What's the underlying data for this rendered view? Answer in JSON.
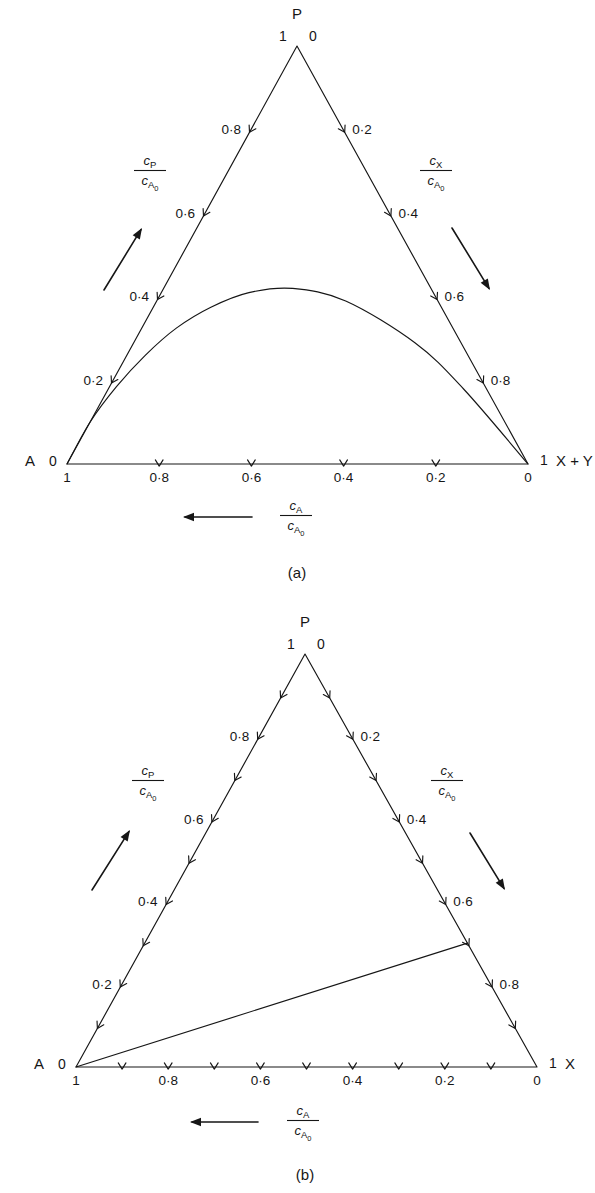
{
  "figure": {
    "type": "ternary-composition-diagrams",
    "panels": [
      {
        "id": "a",
        "caption": "(a)",
        "vertices": {
          "top": {
            "label": "P",
            "left_value": "1",
            "right_value": "0"
          },
          "left": {
            "label": "A",
            "value": "0",
            "bottom_value": "1"
          },
          "right": {
            "label": "X + Y",
            "value": "1",
            "bottom_value": "0"
          }
        },
        "axes": {
          "left": {
            "name": "c_P/c_A0",
            "numerator": "c",
            "numerator_sub": "P",
            "denominator": "c",
            "denominator_sub": "A",
            "denominator_subsub": "0",
            "arrow_direction": "up-right",
            "tick_labels": [
              "0·2",
              "0·4",
              "0·6",
              "0·8"
            ],
            "tick_values": [
              0.2,
              0.4,
              0.6,
              0.8
            ],
            "minor_tick_step": 0.2
          },
          "right": {
            "name": "c_X/c_A0",
            "numerator": "c",
            "numerator_sub": "X",
            "denominator": "c",
            "denominator_sub": "A",
            "denominator_subsub": "0",
            "arrow_direction": "down-right",
            "tick_labels": [
              "0·2",
              "0·4",
              "0·6",
              "0·8"
            ],
            "tick_values": [
              0.2,
              0.4,
              0.6,
              0.8
            ],
            "minor_tick_step": 0.2
          },
          "bottom": {
            "name": "c_A/c_A0",
            "numerator": "c",
            "numerator_sub": "A",
            "denominator": "c",
            "denominator_sub": "A",
            "denominator_subsub": "0",
            "arrow_direction": "left",
            "tick_labels": [
              "1",
              "0·8",
              "0·6",
              "0·4",
              "0·2",
              "0"
            ],
            "tick_values": [
              1.0,
              0.8,
              0.6,
              0.4,
              0.2,
              0.0
            ],
            "minor_tick_step": 0.2
          }
        },
        "curve": {
          "description": "reaction path, peaked arc",
          "shape": "arc",
          "points_ternary": [
            {
              "a": 1.0,
              "p": 0.0,
              "x": 0.0
            },
            {
              "a": 0.9,
              "p": 0.1,
              "x": 0.0
            },
            {
              "a": 0.8,
              "p": 0.185,
              "x": 0.015
            },
            {
              "a": 0.7,
              "p": 0.26,
              "x": 0.04
            },
            {
              "a": 0.6,
              "p": 0.325,
              "x": 0.075
            },
            {
              "a": 0.5,
              "p": 0.375,
              "x": 0.125
            },
            {
              "a": 0.4,
              "p": 0.41,
              "x": 0.19
            },
            {
              "a": 0.3,
              "p": 0.42,
              "x": 0.28
            },
            {
              "a": 0.2,
              "p": 0.39,
              "x": 0.41
            },
            {
              "a": 0.1,
              "p": 0.29,
              "x": 0.61
            },
            {
              "a": 0.05,
              "p": 0.18,
              "x": 0.77
            },
            {
              "a": 0.0,
              "p": 0.0,
              "x": 1.0
            }
          ]
        }
      },
      {
        "id": "b",
        "caption": "(b)",
        "vertices": {
          "top": {
            "label": "P",
            "left_value": "1",
            "right_value": "0"
          },
          "left": {
            "label": "A",
            "value": "0",
            "bottom_value": "1"
          },
          "right": {
            "label": "X",
            "value": "1",
            "bottom_value": "0"
          }
        },
        "axes": {
          "left": {
            "name": "c_P/c_A0",
            "numerator": "c",
            "numerator_sub": "P",
            "denominator": "c",
            "denominator_sub": "A",
            "denominator_subsub": "0",
            "arrow_direction": "up-right",
            "tick_labels": [
              "0·2",
              "0·4",
              "0·6",
              "0·8"
            ],
            "tick_values": [
              0.2,
              0.4,
              0.6,
              0.8
            ],
            "minor_tick_step": 0.1
          },
          "right": {
            "name": "c_X/c_A0",
            "numerator": "c",
            "numerator_sub": "X",
            "denominator": "c",
            "denominator_sub": "A",
            "denominator_subsub": "0",
            "arrow_direction": "down-right",
            "tick_labels": [
              "0·2",
              "0·4",
              "0·6",
              "0·8"
            ],
            "tick_values": [
              0.2,
              0.4,
              0.6,
              0.8
            ],
            "minor_tick_step": 0.1
          },
          "bottom": {
            "name": "c_A/c_A0",
            "numerator": "c",
            "numerator_sub": "A",
            "denominator": "c",
            "denominator_sub": "A",
            "denominator_subsub": "0",
            "arrow_direction": "left",
            "tick_labels": [
              "1",
              "0·8",
              "0·6",
              "0·4",
              "0·2",
              "0"
            ],
            "tick_values": [
              1.0,
              0.8,
              0.6,
              0.4,
              0.2,
              0.0
            ],
            "minor_tick_step": 0.1
          }
        },
        "curve": {
          "description": "reaction path, straight line from A vertex to c_X = 0.3 on right edge",
          "shape": "straight",
          "points_ternary": [
            {
              "a": 1.0,
              "p": 0.0,
              "x": 0.0
            },
            {
              "a": 0.0,
              "p": 0.3,
              "x": 0.7
            }
          ]
        }
      }
    ]
  },
  "chart_data": {
    "type": "line",
    "title": "",
    "subtitle": "",
    "xlabel": "c_A/c_A0",
    "ylabel": "c_P/c_A0",
    "grid": false,
    "legend_position": "none",
    "axis_ranges": {
      "c_A": [
        0,
        1
      ],
      "c_P": [
        0,
        1
      ],
      "c_X": [
        0,
        1
      ]
    },
    "panels": [
      {
        "id": "a",
        "caption": "(a)",
        "corner_labels": [
          "A",
          "P",
          "X + Y"
        ],
        "series": [
          {
            "name": "reaction path (a)",
            "x": [
              1.0,
              0.9,
              0.8,
              0.7,
              0.6,
              0.5,
              0.4,
              0.3,
              0.2,
              0.1,
              0.05,
              0.0
            ],
            "values": [
              0.0,
              0.1,
              0.185,
              0.26,
              0.325,
              0.375,
              0.41,
              0.42,
              0.39,
              0.29,
              0.18,
              0.0
            ]
          }
        ]
      },
      {
        "id": "b",
        "caption": "(b)",
        "corner_labels": [
          "A",
          "P",
          "X"
        ],
        "series": [
          {
            "name": "reaction path (b)",
            "x": [
              1.0,
              0.0
            ],
            "values": [
              0.0,
              0.3
            ]
          }
        ]
      }
    ]
  }
}
